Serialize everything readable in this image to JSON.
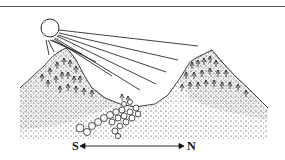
{
  "diagram": {
    "labels": {
      "south": "S",
      "north": "N"
    },
    "elements": [
      "sun",
      "sun-rays",
      "south-mountain",
      "north-mountain",
      "trees",
      "valley-rocks",
      "ground-stipple",
      "direction-arrow"
    ],
    "colors": {
      "ink": "#111111",
      "background": "#ffffff",
      "rule": "#555555"
    }
  }
}
